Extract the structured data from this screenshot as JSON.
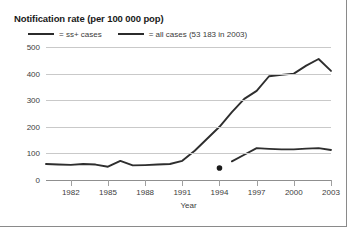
{
  "chart_data": {
    "type": "line",
    "title": "Notification rate (per 100 000 pop)",
    "xlabel": "Year",
    "ylabel": "",
    "xlim": [
      1980,
      2003
    ],
    "ylim": [
      0,
      500
    ],
    "yticks": [
      0,
      100,
      200,
      300,
      400,
      500
    ],
    "ytick_labels": [
      "0",
      "100",
      "200",
      "300",
      "400",
      "500"
    ],
    "xticks": [
      1982,
      1985,
      1988,
      1991,
      1994,
      1997,
      2000,
      2003
    ],
    "xtick_labels": [
      "1982",
      "1985",
      "1988",
      "1991",
      "1994",
      "1997",
      "2000",
      "2003"
    ],
    "grid": true,
    "legend_position": "top-left",
    "series": [
      {
        "name": "ss+ cases",
        "legend_label": "= ss+ cases",
        "color": "#2e2e2e",
        "x": [
          1995,
          1996,
          1997,
          1998,
          1999,
          2000,
          2001,
          2002,
          2003
        ],
        "values": [
          70,
          95,
          120,
          117,
          115,
          115,
          118,
          120,
          113
        ]
      },
      {
        "name": "all cases",
        "legend_label": "= all cases (53 183 in 2003)",
        "color": "#2e2e2e",
        "x": [
          1980,
          1981,
          1982,
          1983,
          1984,
          1985,
          1986,
          1987,
          1988,
          1989,
          1990,
          1991,
          1992,
          1993,
          1994,
          1995,
          1996,
          1997,
          1998,
          1999,
          2000,
          2001,
          2002,
          2003
        ],
        "values": [
          60,
          58,
          57,
          60,
          58,
          50,
          72,
          55,
          56,
          58,
          60,
          72,
          110,
          155,
          200,
          255,
          305,
          335,
          390,
          395,
          400,
          430,
          455,
          410
        ]
      }
    ],
    "annotations": [
      {
        "name": "data-point-marker",
        "x": 1994,
        "y": 45,
        "marker": "filled-circle"
      }
    ]
  },
  "legend": {
    "entries": [
      {
        "label": "= ss+ cases"
      },
      {
        "label": "= all cases (53 183 in 2003)"
      }
    ]
  }
}
